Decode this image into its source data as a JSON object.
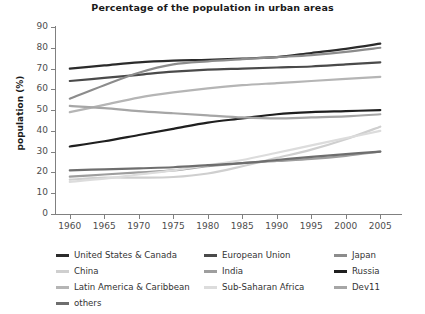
{
  "chart_data": {
    "type": "line",
    "title": "Percentage of the population in urban areas",
    "xlabel": "",
    "ylabel": "population (%)",
    "x": [
      1960,
      1965,
      1970,
      1975,
      1980,
      1985,
      1990,
      1995,
      2000,
      2005
    ],
    "xlim": [
      1958,
      2008
    ],
    "ylim": [
      0,
      90
    ],
    "yticks": [
      0,
      10,
      20,
      30,
      40,
      50,
      60,
      70,
      80,
      90
    ],
    "xticks": [
      "1960",
      "1965",
      "1970",
      "1975",
      "1980",
      "1985",
      "1990",
      "1995",
      "2000",
      "2005"
    ],
    "grid": false,
    "legend_position": "bottom",
    "legend_columns": 3,
    "series": [
      {
        "name": "United States & Canada",
        "color": "#2b2b2b",
        "values": [
          70.0,
          71.5,
          73.0,
          73.8,
          74.2,
          74.8,
          75.5,
          77.5,
          79.5,
          82.0
        ]
      },
      {
        "name": "European Union",
        "color": "#4a4a4a",
        "values": [
          64.0,
          65.5,
          67.0,
          68.5,
          69.5,
          70.0,
          70.5,
          71.0,
          72.0,
          73.0
        ]
      },
      {
        "name": "Japan",
        "color": "#8c8c8c",
        "values": [
          55.5,
          62.0,
          68.0,
          72.0,
          73.5,
          74.5,
          75.5,
          76.5,
          78.0,
          80.0
        ]
      },
      {
        "name": "China",
        "color": "#cfcfcf",
        "values": [
          16.5,
          17.5,
          17.5,
          17.8,
          19.5,
          23.0,
          27.0,
          31.0,
          36.0,
          42.0
        ]
      },
      {
        "name": "India",
        "color": "#9e9e9e",
        "values": [
          18.0,
          19.0,
          20.0,
          21.0,
          23.0,
          24.5,
          25.5,
          26.5,
          28.0,
          30.0
        ]
      },
      {
        "name": "Russia",
        "color": "#1f1f1f",
        "values": [
          32.5,
          35.0,
          38.0,
          41.0,
          44.0,
          46.0,
          48.0,
          49.0,
          49.5,
          50.0
        ]
      },
      {
        "name": "Latin America & Caribbean",
        "color": "#b5b5b5",
        "values": [
          49.0,
          52.5,
          56.0,
          58.5,
          60.5,
          62.0,
          63.0,
          64.0,
          65.0,
          66.0
        ]
      },
      {
        "name": "Sub-Saharan Africa",
        "color": "#dcdcdc",
        "values": [
          15.5,
          17.0,
          19.0,
          21.0,
          23.5,
          26.0,
          29.5,
          33.0,
          36.5,
          40.0
        ]
      },
      {
        "name": "Dev11",
        "color": "#a6a6a6",
        "values": [
          52.0,
          51.0,
          49.5,
          48.5,
          47.5,
          46.5,
          46.0,
          46.5,
          47.0,
          48.0
        ]
      },
      {
        "name": "others",
        "color": "#6e6e6e",
        "values": [
          21.0,
          21.5,
          22.0,
          22.5,
          23.5,
          24.5,
          26.0,
          27.5,
          28.8,
          30.0
        ]
      }
    ]
  },
  "legend": {
    "rows": [
      [
        {
          "label": "United States & Canada",
          "color": "#2b2b2b"
        },
        {
          "label": "European Union",
          "color": "#4a4a4a"
        },
        {
          "label": "Japan",
          "color": "#8c8c8c"
        }
      ],
      [
        {
          "label": "China",
          "color": "#cfcfcf"
        },
        {
          "label": "India",
          "color": "#9e9e9e"
        },
        {
          "label": "Russia",
          "color": "#1f1f1f"
        }
      ],
      [
        {
          "label": "Latin America & Caribbean",
          "color": "#b5b5b5"
        },
        {
          "label": "Sub-Saharan Africa",
          "color": "#dcdcdc"
        },
        {
          "label": "Dev11",
          "color": "#a6a6a6"
        }
      ],
      [
        {
          "label": "others",
          "color": "#6e6e6e"
        }
      ]
    ]
  },
  "axis_color": "#808080",
  "tick_text_color": "#4d4d4d",
  "title_color": "#1a1a1a"
}
